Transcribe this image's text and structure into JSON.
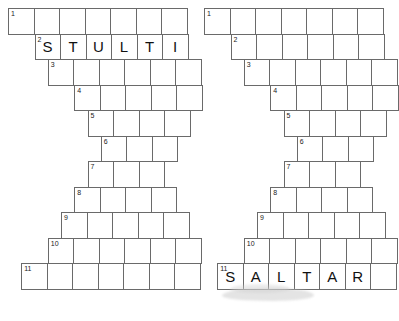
{
  "page": {
    "background_color": "#ffffff",
    "cell_border_color": "#6a6a6a",
    "letter_color": "#111111",
    "number_color": "#1a1a1a"
  },
  "puzzles": [
    {
      "id": "puzzle-left",
      "name": "left-puzzle",
      "rows": [
        {
          "number": "1",
          "cells": 7,
          "indent": 0,
          "letters": [
            "",
            "",
            "",
            "",
            "",
            "",
            ""
          ]
        },
        {
          "number": "2",
          "cells": 6,
          "indent": 1,
          "letters": [
            "S",
            "T",
            "U",
            "L",
            "T",
            "I"
          ]
        },
        {
          "number": "3",
          "cells": 6,
          "indent": 1.5,
          "letters": [
            "",
            "",
            "",
            "",
            "",
            ""
          ]
        },
        {
          "number": "4",
          "cells": 5,
          "indent": 2.5,
          "letters": [
            "",
            "",
            "",
            "",
            ""
          ]
        },
        {
          "number": "5",
          "cells": 4,
          "indent": 3,
          "letters": [
            "",
            "",
            "",
            ""
          ]
        },
        {
          "number": "6",
          "cells": 3,
          "indent": 3.5,
          "letters": [
            "",
            "",
            ""
          ]
        },
        {
          "number": "7",
          "cells": 3,
          "indent": 3,
          "letters": [
            "",
            "",
            ""
          ]
        },
        {
          "number": "8",
          "cells": 4,
          "indent": 2.5,
          "letters": [
            "",
            "",
            "",
            ""
          ]
        },
        {
          "number": "9",
          "cells": 5,
          "indent": 2,
          "letters": [
            "",
            "",
            "",
            "",
            ""
          ]
        },
        {
          "number": "10",
          "cells": 6,
          "indent": 1.5,
          "letters": [
            "",
            "",
            "",
            "",
            "",
            ""
          ]
        },
        {
          "number": "11",
          "cells": 7,
          "indent": 0.5,
          "letters": [
            "",
            "",
            "",
            "",
            "",
            "",
            ""
          ]
        }
      ]
    },
    {
      "id": "puzzle-right",
      "name": "right-puzzle",
      "rows": [
        {
          "number": "1",
          "cells": 7,
          "indent": 0,
          "letters": [
            "",
            "",
            "",
            "",
            "",
            "",
            ""
          ]
        },
        {
          "number": "2",
          "cells": 6,
          "indent": 1,
          "letters": [
            "",
            "",
            "",
            "",
            "",
            ""
          ]
        },
        {
          "number": "3",
          "cells": 6,
          "indent": 1.5,
          "letters": [
            "",
            "",
            "",
            "",
            "",
            ""
          ]
        },
        {
          "number": "4",
          "cells": 5,
          "indent": 2.5,
          "letters": [
            "",
            "",
            "",
            "",
            ""
          ]
        },
        {
          "number": "5",
          "cells": 4,
          "indent": 3,
          "letters": [
            "",
            "",
            "",
            ""
          ]
        },
        {
          "number": "6",
          "cells": 3,
          "indent": 3.5,
          "letters": [
            "",
            "",
            ""
          ]
        },
        {
          "number": "7",
          "cells": 3,
          "indent": 3,
          "letters": [
            "",
            "",
            ""
          ]
        },
        {
          "number": "8",
          "cells": 4,
          "indent": 2.5,
          "letters": [
            "",
            "",
            "",
            ""
          ]
        },
        {
          "number": "9",
          "cells": 5,
          "indent": 2,
          "letters": [
            "",
            "",
            "",
            "",
            ""
          ]
        },
        {
          "number": "10",
          "cells": 6,
          "indent": 1.5,
          "letters": [
            "",
            "",
            "",
            "",
            "",
            ""
          ]
        },
        {
          "number": "11",
          "cells": 7,
          "indent": 0.5,
          "letters": [
            "S",
            "A",
            "L",
            "T",
            "A",
            "R",
            ""
          ]
        }
      ]
    }
  ]
}
